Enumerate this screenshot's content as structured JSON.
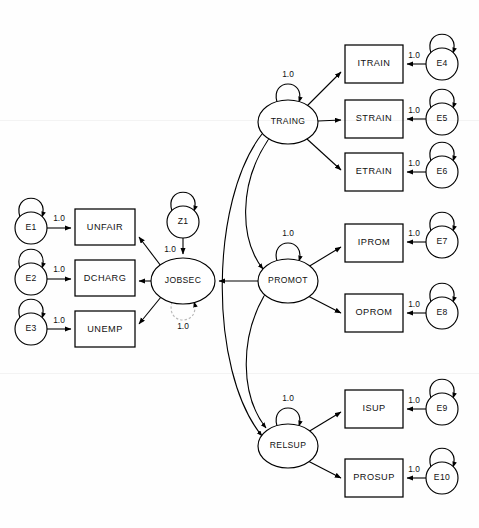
{
  "diagram": {
    "type": "sem-path-diagram",
    "title": "",
    "width": 479,
    "height": 528,
    "background_color": "#ffffff",
    "line_color": "#000000",
    "dashed_loop_color": "#b9b9b9"
  },
  "latent_variables": [
    {
      "id": "JOBSEC",
      "label": "JOBSEC",
      "cx": 183,
      "cy": 281,
      "rx": 32,
      "ry": 23
    },
    {
      "id": "TRAING",
      "label": "TRAING",
      "cx": 288,
      "cy": 122,
      "rx": 30,
      "ry": 22
    },
    {
      "id": "PROMOT",
      "label": "PROMOT",
      "cx": 288,
      "cy": 281,
      "rx": 30,
      "ry": 22
    },
    {
      "id": "RELSUP",
      "label": "RELSUP",
      "cx": 288,
      "cy": 446,
      "rx": 30,
      "ry": 22
    }
  ],
  "disturbance_variables": [
    {
      "id": "Z1",
      "label": "Z1",
      "cx": 183,
      "cy": 222,
      "r": 16
    }
  ],
  "error_variables": [
    {
      "id": "E1",
      "label": "E1",
      "cx": 31,
      "cy": 228,
      "r": 16
    },
    {
      "id": "E2",
      "label": "E2",
      "cx": 31,
      "cy": 279,
      "r": 16
    },
    {
      "id": "E3",
      "label": "E3",
      "cx": 31,
      "cy": 329,
      "r": 16
    },
    {
      "id": "E4",
      "label": "E4",
      "cx": 442,
      "cy": 64,
      "r": 16
    },
    {
      "id": "E5",
      "label": "E5",
      "cx": 442,
      "cy": 119,
      "r": 16
    },
    {
      "id": "E6",
      "label": "E6",
      "cx": 442,
      "cy": 172,
      "r": 16
    },
    {
      "id": "E7",
      "label": "E7",
      "cx": 442,
      "cy": 242,
      "r": 16
    },
    {
      "id": "E8",
      "label": "E8",
      "cx": 442,
      "cy": 313,
      "r": 16
    },
    {
      "id": "E9",
      "label": "E9",
      "cx": 442,
      "cy": 409,
      "r": 16
    },
    {
      "id": "E10",
      "label": "E10",
      "cx": 442,
      "cy": 478,
      "r": 16
    }
  ],
  "observed_variables": [
    {
      "id": "UNFAIR",
      "label": "UNFAIR",
      "x": 75,
      "y": 209,
      "w": 60,
      "h": 36
    },
    {
      "id": "DCHARG",
      "label": "DCHARG",
      "x": 75,
      "y": 260,
      "w": 60,
      "h": 36
    },
    {
      "id": "UNEMP",
      "label": "UNEMP",
      "x": 75,
      "y": 311,
      "w": 60,
      "h": 36
    },
    {
      "id": "ITRAIN",
      "label": "ITRAIN",
      "x": 345,
      "y": 45,
      "w": 58,
      "h": 38
    },
    {
      "id": "STRAIN",
      "label": "STRAIN",
      "x": 345,
      "y": 100,
      "w": 58,
      "h": 38
    },
    {
      "id": "ETRAIN",
      "label": "ETRAIN",
      "x": 345,
      "y": 153,
      "w": 58,
      "h": 38
    },
    {
      "id": "IPROM",
      "label": "IPROM",
      "x": 345,
      "y": 224,
      "w": 58,
      "h": 38
    },
    {
      "id": "OPROM",
      "label": "OPROM",
      "x": 345,
      "y": 294,
      "w": 58,
      "h": 38
    },
    {
      "id": "ISUP",
      "label": "ISUP",
      "x": 345,
      "y": 390,
      "w": 58,
      "h": 38
    },
    {
      "id": "PROSUP",
      "label": "PROSUP",
      "x": 345,
      "y": 459,
      "w": 58,
      "h": 38
    }
  ],
  "error_paths": [
    {
      "from": "E1",
      "to": "UNFAIR",
      "label": "1.0",
      "label_x": 59,
      "label_y": 219
    },
    {
      "from": "E2",
      "to": "DCHARG",
      "label": "1.0",
      "label_x": 59,
      "label_y": 270
    },
    {
      "from": "E3",
      "to": "UNEMP",
      "label": "1.0",
      "label_x": 59,
      "label_y": 321
    },
    {
      "from": "E4",
      "to": "ITRAIN",
      "label": "1.0",
      "label_x": 414,
      "label_y": 56
    },
    {
      "from": "E5",
      "to": "STRAIN",
      "label": "1.0",
      "label_x": 414,
      "label_y": 111
    },
    {
      "from": "E6",
      "to": "ETRAIN",
      "label": "1.0",
      "label_x": 414,
      "label_y": 164
    },
    {
      "from": "E7",
      "to": "IPROM",
      "label": "1.0",
      "label_x": 414,
      "label_y": 234
    },
    {
      "from": "E8",
      "to": "OPROM",
      "label": "1.0",
      "label_x": 414,
      "label_y": 305
    },
    {
      "from": "E9",
      "to": "ISUP",
      "label": "1.0",
      "label_x": 414,
      "label_y": 401
    },
    {
      "from": "E10",
      "to": "PROSUP",
      "label": "1.0",
      "label_x": 414,
      "label_y": 470
    }
  ],
  "disturbance_path": {
    "from": "Z1",
    "to": "JOBSEC",
    "label": "1.0",
    "label_x": 170,
    "label_y": 250
  },
  "factor_loadings": [
    {
      "from": "JOBSEC",
      "to": "UNFAIR"
    },
    {
      "from": "JOBSEC",
      "to": "DCHARG"
    },
    {
      "from": "JOBSEC",
      "to": "UNEMP"
    },
    {
      "from": "TRAING",
      "to": "ITRAIN"
    },
    {
      "from": "TRAING",
      "to": "STRAIN"
    },
    {
      "from": "TRAING",
      "to": "ETRAIN"
    },
    {
      "from": "PROMOT",
      "to": "IPROM"
    },
    {
      "from": "PROMOT",
      "to": "OPROM"
    },
    {
      "from": "RELSUP",
      "to": "ISUP"
    },
    {
      "from": "RELSUP",
      "to": "PROSUP"
    }
  ],
  "structural_paths": [
    {
      "from": "TRAING",
      "to": "JOBSEC"
    },
    {
      "from": "PROMOT",
      "to": "JOBSEC"
    },
    {
      "from": "RELSUP",
      "to": "JOBSEC"
    }
  ],
  "covariances": [
    {
      "between": [
        "TRAING",
        "PROMOT"
      ],
      "style": "solid"
    },
    {
      "between": [
        "PROMOT",
        "RELSUP"
      ],
      "style": "solid"
    },
    {
      "between": [
        "TRAING",
        "RELSUP"
      ],
      "style": "solid"
    }
  ],
  "variance_loops": [
    {
      "on": "TRAING",
      "label": "1.0",
      "label_x": 288,
      "label_y": 75,
      "style": "solid",
      "direction": "up"
    },
    {
      "on": "PROMOT",
      "label": "1.0",
      "label_x": 288,
      "label_y": 234,
      "style": "solid",
      "direction": "up"
    },
    {
      "on": "RELSUP",
      "label": "1.0",
      "label_x": 288,
      "label_y": 399,
      "style": "solid",
      "direction": "up"
    },
    {
      "on": "JOBSEC",
      "label": "1.0",
      "label_x": 183,
      "label_y": 327,
      "style": "dashed",
      "direction": "down"
    }
  ],
  "error_loops": [
    {
      "on": "E1"
    },
    {
      "on": "E2"
    },
    {
      "on": "E3"
    },
    {
      "on": "E4"
    },
    {
      "on": "E5"
    },
    {
      "on": "E6"
    },
    {
      "on": "E7"
    },
    {
      "on": "E8"
    },
    {
      "on": "E9"
    },
    {
      "on": "E10"
    },
    {
      "on": "Z1"
    }
  ]
}
